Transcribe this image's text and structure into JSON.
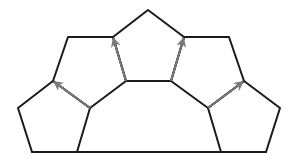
{
  "diagram": {
    "title": "",
    "colors": {
      "edge": "#1a1a1a",
      "arrow": "#7a7a7a",
      "background": "#ffffff"
    },
    "pentagons": [
      {
        "id": "left-lower",
        "points": "53,81 18,108 32,152 77,152 90,108"
      },
      {
        "id": "left-upper",
        "points": "68,37 113,37 126,81 90,108 53,81"
      },
      {
        "id": "top",
        "points": "148,10 184,37 171,81 126,81 113,37"
      },
      {
        "id": "right-upper",
        "points": "184,37 229,37 244,81 208,108 171,81"
      },
      {
        "id": "right-lower",
        "points": "244,81 280,108 266,152 221,152 208,108"
      }
    ],
    "base_line": {
      "x1": 32,
      "y1": 152,
      "x2": 266,
      "y2": 152
    },
    "arrows": [
      {
        "id": "arrow-1",
        "from": [
          90,
          108
        ],
        "to": [
          53,
          81
        ]
      },
      {
        "id": "arrow-2",
        "from": [
          126,
          81
        ],
        "to": [
          113,
          37
        ]
      },
      {
        "id": "arrow-3",
        "from": [
          171,
          81
        ],
        "to": [
          184,
          37
        ]
      },
      {
        "id": "arrow-4",
        "from": [
          208,
          108
        ],
        "to": [
          244,
          81
        ]
      }
    ]
  }
}
